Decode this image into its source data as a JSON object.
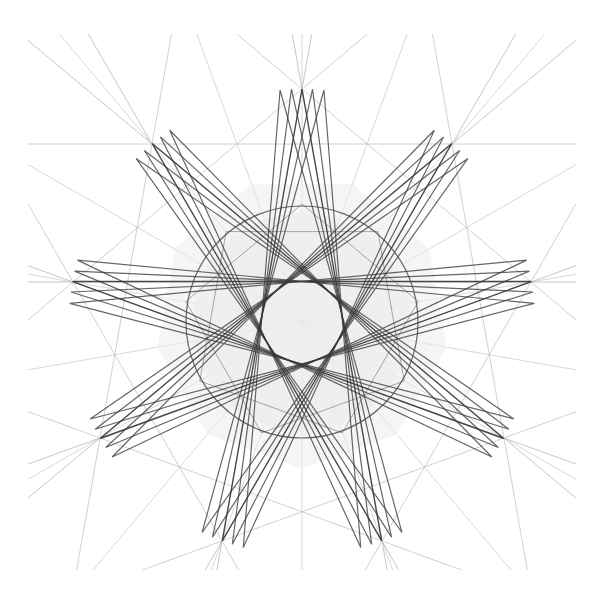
{
  "figure": {
    "canvas": {
      "width": 602,
      "height": 602,
      "background_color": "#ffffff"
    },
    "construction": {
      "center_x": 302,
      "center_y": 322,
      "vertex_count": 9,
      "circumradius": 233,
      "start_angle_degrees": -90,
      "star_step": 4,
      "inner_star_step": 2,
      "inner_ring_radius": 118,
      "inner_fill_radius": 110
    },
    "styles": {
      "extended_line_color": "#b9b9b9",
      "extended_line_width": 0.8,
      "chord_color": "#3a3a3a",
      "chord_width": 1.35,
      "inner_chord_color": "#9a9a9a",
      "inner_chord_width": 0.9,
      "fill_color": "#ececec",
      "fill_opacity": 0.75,
      "ring_color": "#4a4a4a",
      "ring_width": 1.2
    },
    "extension_clip": {
      "min_x": 28,
      "min_y": 34,
      "max_x": 576,
      "max_y": 570
    },
    "layers": [
      {
        "name": "extended-lines",
        "label": "Extended chord rays",
        "color": "#b9b9b9"
      },
      {
        "name": "inner-fill",
        "label": "Shaded inner core",
        "color": "#ececec"
      },
      {
        "name": "inner-star",
        "label": "Faint inner star",
        "color": "#9a9a9a"
      },
      {
        "name": "outer-star",
        "label": "Dark nonagram chords",
        "color": "#3a3a3a"
      },
      {
        "name": "inner-envelope",
        "label": "Inner circular envelope",
        "color": "#4a4a4a"
      }
    ],
    "vertices": [
      {
        "index": 0,
        "label": "V0",
        "angle_degrees": -90,
        "x": 302,
        "y": 89
      },
      {
        "index": 1,
        "label": "V1",
        "angle_degrees": -50,
        "x": 452,
        "y": 144
      },
      {
        "index": 2,
        "label": "V2",
        "angle_degrees": -10,
        "x": 531,
        "y": 282
      },
      {
        "index": 3,
        "label": "V3",
        "angle_degrees": 30,
        "x": 504,
        "y": 438
      },
      {
        "index": 4,
        "label": "V4",
        "angle_degrees": 70,
        "x": 382,
        "y": 541
      },
      {
        "index": 5,
        "label": "V5",
        "angle_degrees": 110,
        "x": 222,
        "y": 541
      },
      {
        "index": 6,
        "label": "V6",
        "angle_degrees": 150,
        "x": 100,
        "y": 438
      },
      {
        "index": 7,
        "label": "V7",
        "angle_degrees": 190,
        "x": 73,
        "y": 282
      },
      {
        "index": 8,
        "label": "V8",
        "angle_degrees": 230,
        "x": 152,
        "y": 144
      }
    ],
    "chord_sequence": [
      0,
      4,
      8,
      3,
      7,
      2,
      6,
      1,
      5,
      0
    ],
    "inner_chord_sequence": [
      0,
      2,
      4,
      6,
      8,
      1,
      3,
      5,
      7,
      0
    ]
  }
}
